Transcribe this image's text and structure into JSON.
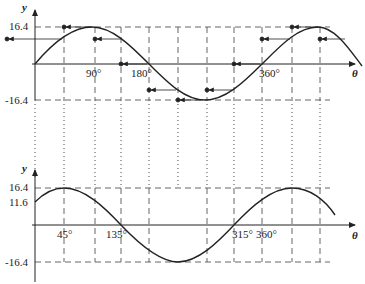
{
  "top_plot": {
    "y_axis_label": "y",
    "x_axis_label": "θ",
    "y_ticks": [
      "16.4",
      "-16.4"
    ],
    "x_ticks": [
      "90°",
      "180°",
      "360°"
    ],
    "curve": "y = 16.4 sin θ",
    "amplitude": 16.4
  },
  "bottom_plot": {
    "y_axis_label": "y",
    "x_axis_label": "θ",
    "y_ticks": [
      "16.4",
      "11.6",
      "-16.4"
    ],
    "x_ticks": [
      "45°",
      "135°",
      "315°",
      "360°"
    ],
    "curve": "shifted sine (phase 45°)",
    "amplitude": 16.4,
    "y_intercept": 11.6
  },
  "colors": {
    "line": "#222222",
    "grid": "#555555"
  }
}
